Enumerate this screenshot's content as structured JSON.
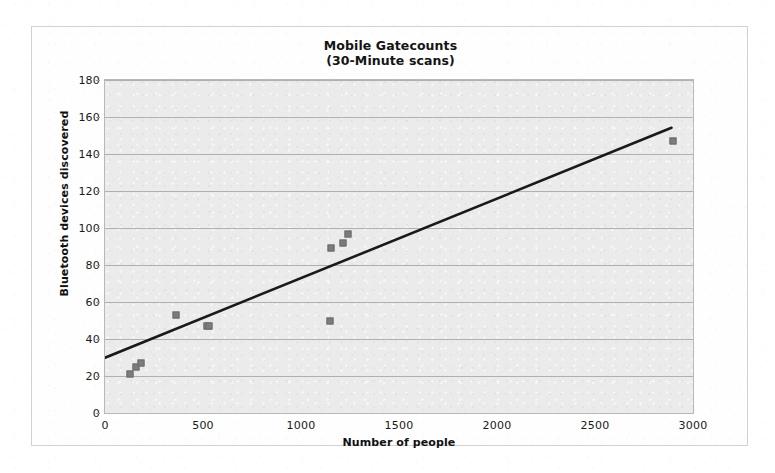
{
  "chart_data": {
    "type": "scatter",
    "title": "Mobile Gatecounts",
    "subtitle": "(30-Minute scans)",
    "xlabel": "Number of people",
    "ylabel": "Bluetooth devices discovered",
    "xlim": [
      0,
      3000
    ],
    "ylim": [
      0,
      180
    ],
    "x_ticks": [
      0,
      500,
      1000,
      1500,
      2000,
      2500,
      3000
    ],
    "y_ticks": [
      0,
      20,
      40,
      60,
      80,
      100,
      120,
      140,
      160,
      180
    ],
    "grid": "horizontal",
    "legend": "none",
    "marker_color": "#7c7c7c",
    "trendline_color": "#1a1a1a",
    "plot_background": "#ebebeb",
    "points": [
      {
        "x": 130,
        "y": 21
      },
      {
        "x": 160,
        "y": 25
      },
      {
        "x": 185,
        "y": 27
      },
      {
        "x": 360,
        "y": 53
      },
      {
        "x": 520,
        "y": 47
      },
      {
        "x": 530,
        "y": 47
      },
      {
        "x": 1150,
        "y": 50
      },
      {
        "x": 1155,
        "y": 89
      },
      {
        "x": 1215,
        "y": 92
      },
      {
        "x": 1240,
        "y": 97
      },
      {
        "x": 2900,
        "y": 147
      }
    ],
    "trendline": {
      "type": "linear",
      "x_start": 0,
      "y_start": 29,
      "x_end": 2900,
      "y_end": 154
    }
  },
  "chart": {
    "title_line1": "Mobile Gatecounts",
    "title_line2": "(30-Minute scans)",
    "y_axis_title": "Bluetooth devices discovered",
    "x_axis_title": "Number of people"
  }
}
